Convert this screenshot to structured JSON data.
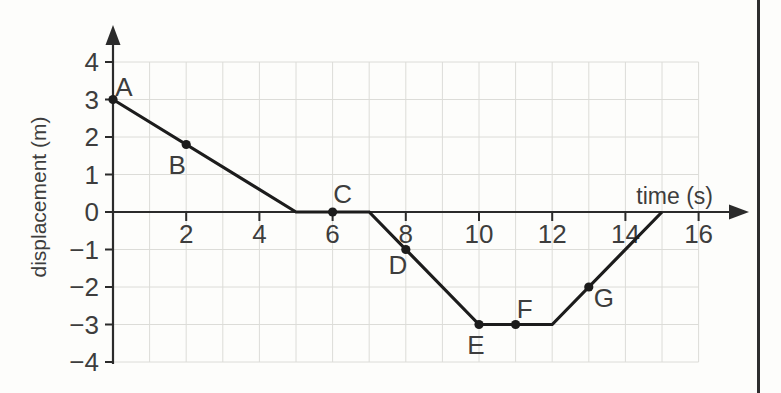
{
  "colors": {
    "background": "#fdfdfb",
    "line": "#1c1c1c",
    "axis": "#2b2b2b",
    "grid": "#dcdcd8",
    "text": "#3d3d3d",
    "page_edge": "#2e2e2e"
  },
  "chart_data": {
    "type": "line",
    "title": "",
    "xlabel": "time (s)",
    "ylabel": "displacement (m)",
    "xlim": [
      0,
      17
    ],
    "ylim": [
      -4,
      5
    ],
    "grid": {
      "show": true,
      "x_range": [
        0,
        16
      ],
      "y_range": [
        -4,
        4
      ],
      "x_step": 1,
      "y_step": 1
    },
    "x_ticks": [
      {
        "v": 2,
        "label": "2"
      },
      {
        "v": 4,
        "label": "4"
      },
      {
        "v": 6,
        "label": "6"
      },
      {
        "v": 8,
        "label": "8"
      },
      {
        "v": 10,
        "label": "10"
      },
      {
        "v": 12,
        "label": "12"
      },
      {
        "v": 14,
        "label": "14"
      },
      {
        "v": 16,
        "label": "16"
      }
    ],
    "y_ticks": [
      {
        "v": 4,
        "label": "4"
      },
      {
        "v": 3,
        "label": "3"
      },
      {
        "v": 2,
        "label": "2"
      },
      {
        "v": 1,
        "label": "1"
      },
      {
        "v": 0,
        "label": "0"
      },
      {
        "v": -1,
        "label": "−1"
      },
      {
        "v": -2,
        "label": "−2"
      },
      {
        "v": -3,
        "label": "−3"
      },
      {
        "v": -4,
        "label": "−4"
      }
    ],
    "series": [
      {
        "name": "displacement",
        "points": [
          [
            0,
            3
          ],
          [
            5,
            0
          ],
          [
            7,
            0
          ],
          [
            10,
            -3
          ],
          [
            12,
            -3
          ],
          [
            15,
            0
          ]
        ]
      }
    ],
    "labeled_points": [
      {
        "label": "A",
        "x": 0,
        "y": 3,
        "dx": 11,
        "dy": -4
      },
      {
        "label": "B",
        "x": 2,
        "y": 1.8,
        "dx": -9,
        "dy": 29
      },
      {
        "label": "C",
        "x": 6,
        "y": 0,
        "dx": 10,
        "dy": -9
      },
      {
        "label": "D",
        "x": 8,
        "y": -1,
        "dx": -8,
        "dy": 24
      },
      {
        "label": "E",
        "x": 10,
        "y": -3,
        "dx": -3,
        "dy": 29
      },
      {
        "label": "F",
        "x": 11,
        "y": -3,
        "dx": 9,
        "dy": -7
      },
      {
        "label": "G",
        "x": 13,
        "y": -2,
        "dx": 15,
        "dy": 20
      }
    ]
  }
}
